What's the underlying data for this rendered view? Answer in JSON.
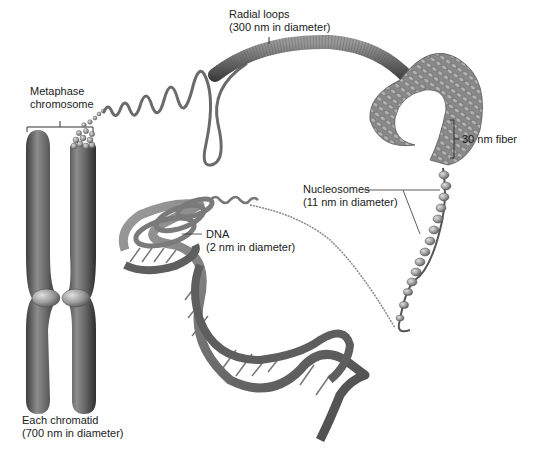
{
  "labels": {
    "metaphase": {
      "line1": "Metaphase",
      "line2": "chromosome"
    },
    "radial": {
      "line1": "Radial loops",
      "line2": "(300 nm in diameter)"
    },
    "fiber30": {
      "line1": "30 nm fiber"
    },
    "nucleosomes": {
      "line1": "Nucleosomes",
      "line2": "(11 nm in diameter)"
    },
    "dna": {
      "line1": "DNA",
      "line2": "(2 nm in diameter)"
    },
    "chromatid": {
      "line1": "Each chromatid",
      "line2": "(700 nm in diameter)"
    }
  },
  "colors": {
    "structure_dark": "#4a4a4a",
    "structure_mid": "#8a8a8a",
    "structure_light": "#c8c8c8",
    "leader_line": "#333333",
    "background": "#ffffff"
  }
}
